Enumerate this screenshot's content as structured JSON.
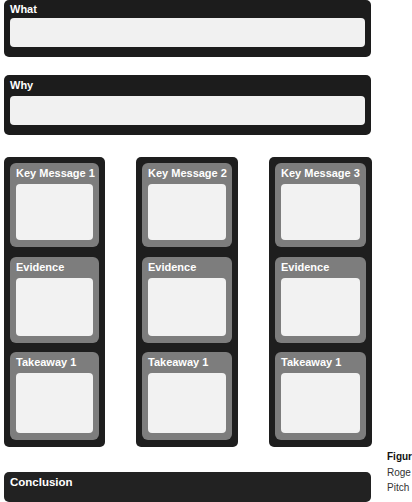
{
  "what": {
    "label": "What"
  },
  "why": {
    "label": "Why"
  },
  "columns": [
    {
      "sections": [
        {
          "label": "Key Message 1"
        },
        {
          "label": "Evidence"
        },
        {
          "label": "Takeaway 1"
        }
      ]
    },
    {
      "sections": [
        {
          "label": "Key Message 2"
        },
        {
          "label": "Evidence"
        },
        {
          "label": "Takeaway 1"
        }
      ]
    },
    {
      "sections": [
        {
          "label": "Key Message 3"
        },
        {
          "label": "Evidence"
        },
        {
          "label": "Takeaway 1"
        }
      ]
    }
  ],
  "conclusion": {
    "label": "Conclusion"
  },
  "caption": {
    "lines": [
      "Figur",
      "Roge",
      "Pitch"
    ]
  },
  "colors": {
    "dark": "#1c1c1c",
    "section": "#7d7d7d",
    "box": "#f1f1f1"
  }
}
